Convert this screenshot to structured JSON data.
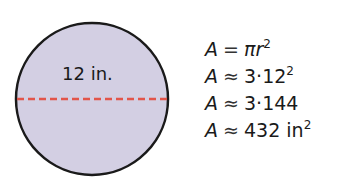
{
  "diagram": {
    "shape": "circle",
    "fill_color": "#d3cfe3",
    "stroke_color": "#1a1a1a",
    "diameter_line_color": "#e2554a",
    "diameter_label": "12 in."
  },
  "equations": [
    {
      "lhs": "A",
      "op": "=",
      "rhs": "πr",
      "exp": "2"
    },
    {
      "lhs": "A",
      "op": "≈",
      "rhs": "3·12",
      "exp": "2"
    },
    {
      "lhs": "A",
      "op": "≈",
      "rhs": "3·144",
      "exp": ""
    },
    {
      "lhs": "A",
      "op": "≈",
      "rhs": "432 in",
      "exp": "2"
    }
  ]
}
